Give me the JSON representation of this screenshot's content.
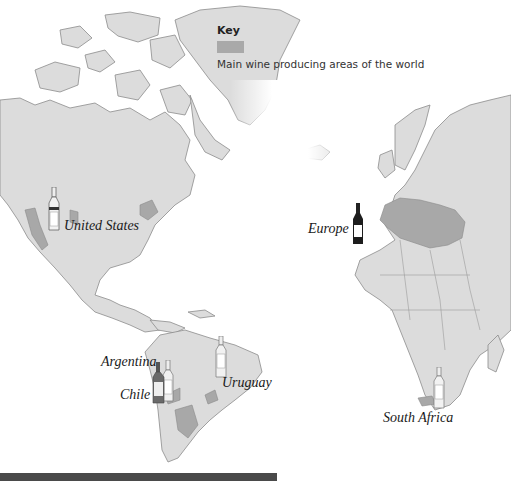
{
  "key": {
    "title": "Key",
    "swatch_color": "#a9a9a9",
    "description": "Main wine producing areas of the world"
  },
  "regions": [
    {
      "label": "United States",
      "bottle": "white"
    },
    {
      "label": "Europe",
      "bottle": "red"
    },
    {
      "label": "Argentina",
      "bottle": "white"
    },
    {
      "label": "Chile",
      "bottle": "red"
    },
    {
      "label": "Uruguay",
      "bottle": "white"
    },
    {
      "label": "South Africa",
      "bottle": "white"
    }
  ],
  "colors": {
    "land": "#dcdcdc",
    "wine_area": "#a8a8a8",
    "coast": "#8c8c8c",
    "bottom_bar": "#4a4a4a"
  }
}
